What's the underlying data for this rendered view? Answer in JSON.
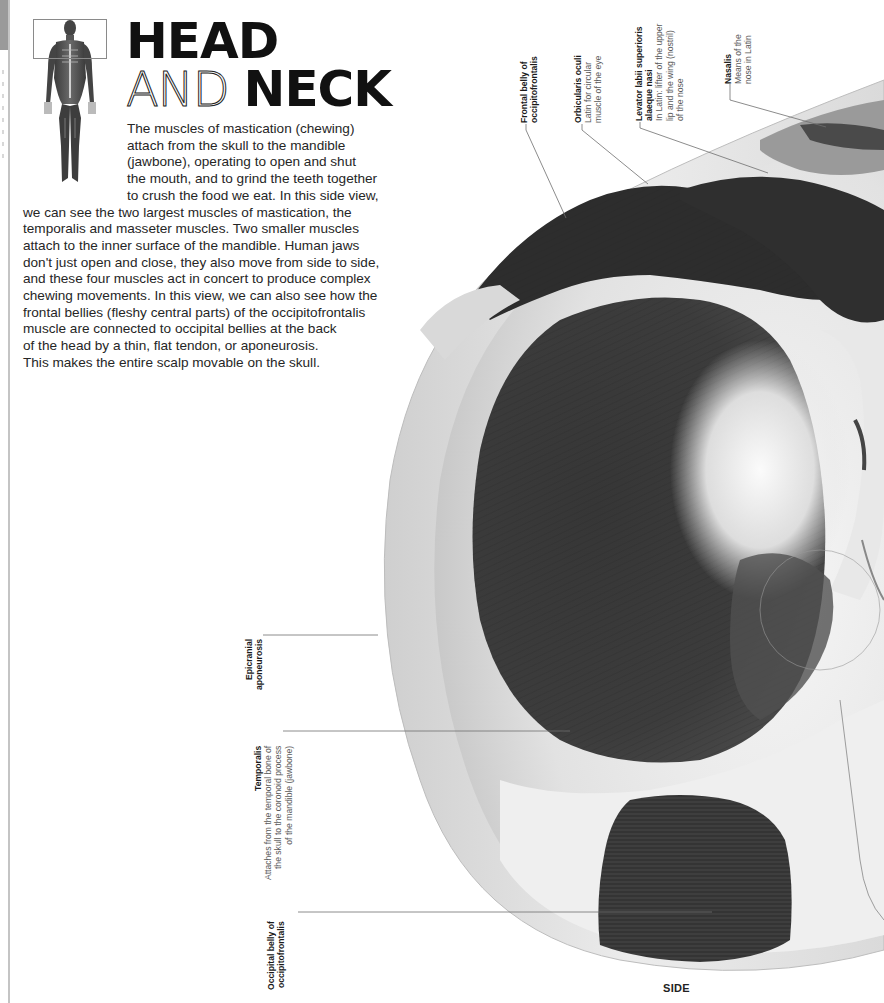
{
  "page": {
    "title_line1": "HEAD",
    "title_line2_thin": "AND",
    "title_line2_bold": "NECK",
    "intro_lines": [
      "The muscles of mastication (chewing)",
      "attach from the skull to the mandible",
      "(jawbone), operating to open and shut",
      "the mouth, and to grind the teeth together",
      "to crush the food we eat. In this side view,",
      "we can see the two largest muscles of mastication, the",
      "temporalis and masseter muscles. Two smaller muscles",
      "attach to the inner surface of the mandible. Human jaws",
      "don't just open and close, they also move from side to side,",
      "and these four muscles act in concert to produce complex",
      "chewing movements. In this view, we can also see how the",
      "frontal bellies (fleshy central parts) of the occipitofrontalis",
      "muscle are connected to occipital bellies at the back",
      "of the head by a thin, flat tendon, or aponeurosis.",
      "This makes the entire scalp movable on the skull."
    ],
    "view_label": "SIDE"
  },
  "thumbnail": {
    "icon": "full-body-muscle-figure-icon",
    "highlight": "head-region"
  },
  "labels": {
    "frontal_belly": {
      "title_1": "Frontal belly of",
      "title_2": "occipitofrontalis"
    },
    "orbicularis_oculi": {
      "title": "Orbicularis oculi",
      "desc_1": "Latin for circular",
      "desc_2": "muscle of the eye"
    },
    "levator_labii": {
      "title_1": "Levator labii superioris",
      "title_2": "alaeque nasi",
      "desc_1": "In Latin: lifter of the upper",
      "desc_2": "lip and the wing (nostril)",
      "desc_3": "of the nose"
    },
    "nasalis": {
      "title": "Nasalis",
      "desc_1": "Means of the",
      "desc_2": "nose in Latin"
    },
    "epicranial": {
      "title_1": "Epicranial",
      "title_2": "aponeurosis"
    },
    "temporalis": {
      "title": "Temporalis",
      "desc_1": "Attaches from the temporal bone of",
      "desc_2": "the skull to the coronoid process",
      "desc_3": "of the mandible (jawbone)"
    },
    "occipital_belly": {
      "title_1": "Occipital belly of",
      "title_2": "occipitofrontalis"
    }
  },
  "colors": {
    "page_tab": "#9a9a9a",
    "leader_line": "#6e6e6e",
    "muscle_dark": "#2e2e2e",
    "aponeurosis": "#dcdcdc"
  }
}
